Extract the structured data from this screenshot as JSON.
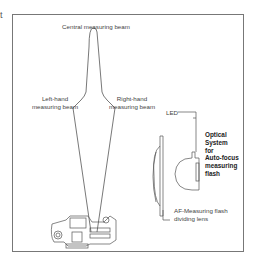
{
  "figure": {
    "corner_text": "t",
    "labels": {
      "central_beam": "Central measuring beam",
      "left_beam_line1": "Left-hand",
      "left_beam_line2": "measuring beam",
      "right_beam_line1": "Right-hand",
      "right_beam_line2": "measuring beam",
      "led": "LED",
      "optical_line1": "Optical",
      "optical_line2": "System",
      "optical_line3": "for",
      "optical_line4": "Auto-focus",
      "optical_line5": "measuring",
      "optical_line6": "flash",
      "dividing_line1": "AF-Measuring flash",
      "dividing_line2": "dividing lens"
    }
  }
}
